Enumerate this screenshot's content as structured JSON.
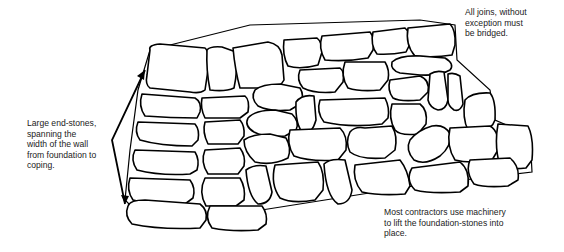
{
  "figure": {
    "annotations": {
      "end_stones": "Large end-stones,\nspanning the\nwidth of the wall\nfrom foundation to\ncoping.",
      "joins": "All joins, without\nexception must\nbe bridged.",
      "foundation": "Most contractors use machinery\nto lift the foundation-stones into\nplace."
    },
    "arrow": {
      "type": "double-headed",
      "label_ref": "end_stones",
      "from": "coping",
      "to": "foundation"
    }
  }
}
